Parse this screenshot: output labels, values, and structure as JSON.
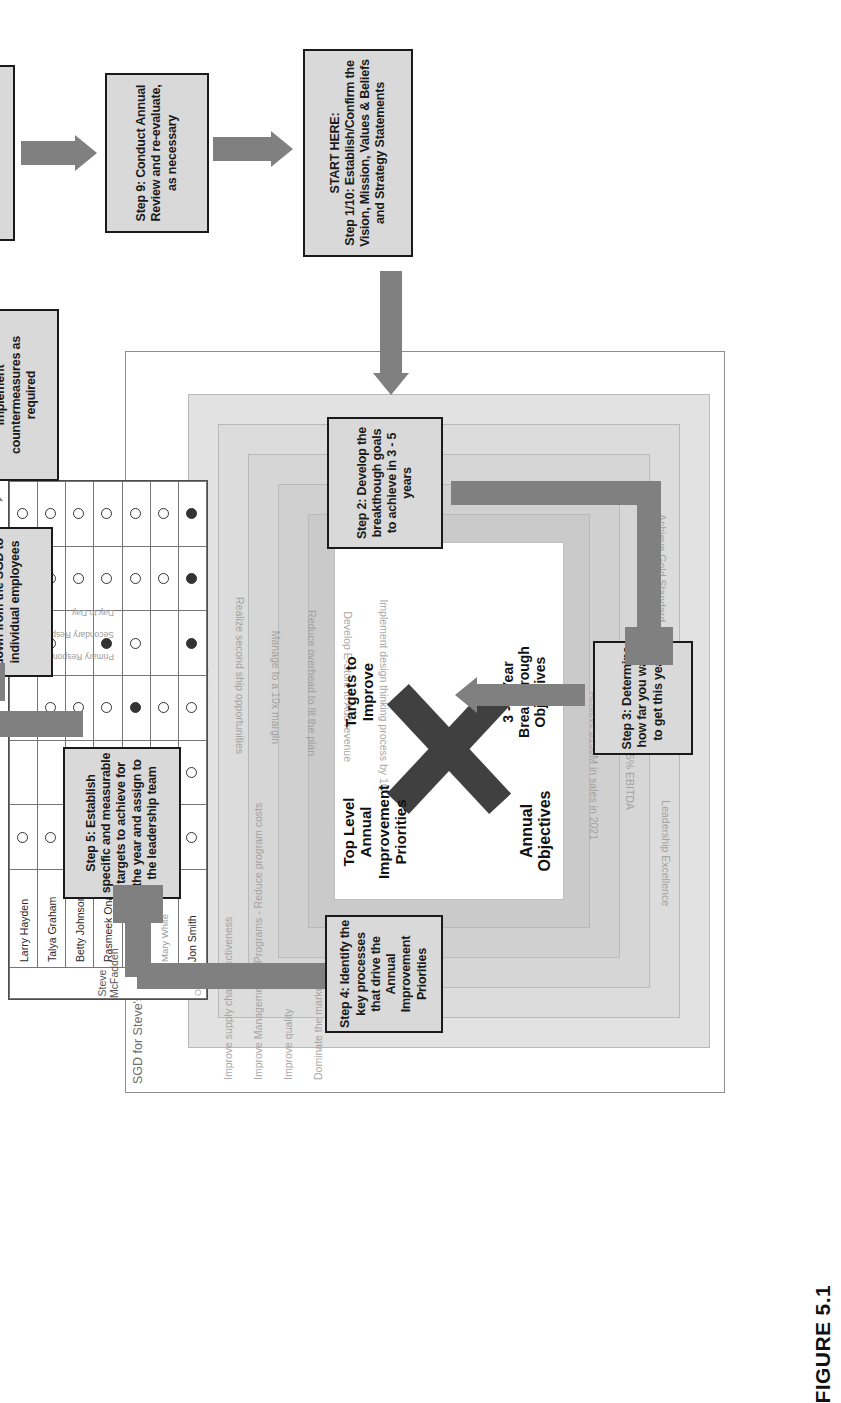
{
  "figure": {
    "caption": "FIGURE 5.1"
  },
  "matrix": {
    "title": "SGD for Steve's Muffler Bearing Company - Level 0 X Matrix",
    "center": {
      "top_label": "Top Level Annual Improvement Priorities",
      "right_label": "Targets to Improve",
      "bottom_label": "Annual Objectives",
      "left_label": "3 - 5 Year Breakthrough Objectives"
    },
    "left_axis_items": [
      "Improve supply chain effectiveness",
      "Improve Management of Programs - Reduce program costs",
      "Improve quality",
      "Dominate the market"
    ],
    "right_axis_items": [
      "Consut risk assessment with key suppliers",
      "Redesign processes",
      "Realize second ship opportunities",
      "Manage to a 10x margin",
      "Reduce overhead to fit the plan",
      "Develop E-Store to Add revenue",
      "Implement design thinking process by 1Q"
    ],
    "bottom_axis_items": [
      "Achieve $150M in sales in 2021",
      "15% EBITDA",
      "Leadership Excellence",
      "Achieve Gold Standard"
    ],
    "responsibility": {
      "owner_group_label": "Owner",
      "lead_group_label": "Steve McFadden",
      "legend": [
        "Primary Responsibility",
        "Secondary Responsibility",
        "Day to Day"
      ],
      "people": [
        "Jon Smith",
        "Mary White",
        "Bill Jones",
        "Rasmeek Onan",
        "Betty Johnson",
        "Talya Graham",
        "Larry Hayden"
      ],
      "rows": [
        {
          "name": "Jon Smith",
          "marks": [
            "filled",
            "filled",
            "open",
            "filled",
            "open",
            "open",
            "open"
          ]
        },
        {
          "name": "Mary White",
          "marks": [
            "open",
            "open",
            "",
            "",
            "open",
            "",
            ""
          ]
        },
        {
          "name": "Bill Jones",
          "marks": [
            "open",
            "open",
            "",
            "open",
            "filled",
            "open",
            "open"
          ]
        },
        {
          "name": "Rasmeek Onan",
          "marks": [
            "open",
            "open",
            "filled",
            "",
            "open",
            "open",
            "open"
          ]
        },
        {
          "name": "Betty Johnson",
          "marks": [
            "open",
            "open",
            "",
            "",
            "open",
            "filled",
            "filled"
          ]
        },
        {
          "name": "Talya Graham",
          "marks": [
            "open",
            "open",
            "open",
            "",
            "open",
            "",
            "open"
          ]
        },
        {
          "name": "Larry Hayden",
          "marks": [
            "open",
            "open",
            "",
            "",
            "open",
            "",
            ""
          ]
        }
      ]
    }
  },
  "steps": {
    "start": "START HERE:\nStep 1/10: Establish/Confirm the Vision, Mission, Values & Beliefs and Strategy Statements",
    "start_title": "START HERE:",
    "start_body": "Step 1/10: Establish/Confirm the Vision, Mission, Values & Beliefs and Strategy Statements",
    "step2": "Step 2: Develop the breakthough goals to achieve in 3 - 5 years",
    "step3": "Step 3: Determine how far you want to get this year",
    "step4": "Step 4: Identify the key processes that drive the Annual Improvement Priorities",
    "step5": "Step 5: Establish specific and measurable targets to achieve for the year and assign to the leadership team",
    "step6": "Step 6: Cascade goals down from the SGD to individual employees",
    "step7": "Step 7: Execute against the Targets to Improve & implement countermeasures as required",
    "step8": "Step 8: Conduct monthly performance reviews",
    "step9": "Step 9: Conduct Annual Review and re-evaluate, as necessary"
  },
  "colors": {
    "arrow": "#808080",
    "box_fill": "#d9d9d9",
    "box_border": "#1a1a1a",
    "x_fill": "#404040",
    "faint_text": "#9a9a9a"
  }
}
